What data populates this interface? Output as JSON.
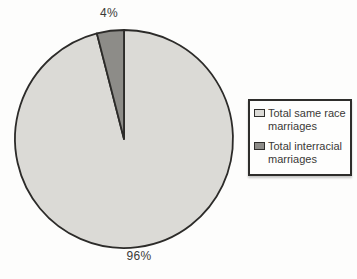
{
  "chart_data": {
    "type": "pie",
    "labels": [
      "Total same race marriages",
      "Total interracial marriages"
    ],
    "values": [
      96,
      4
    ],
    "value_labels": [
      "96%",
      "4%"
    ],
    "colors": [
      "#dbdad6",
      "#8d8c88"
    ],
    "stroke_color": "#2c2b29",
    "title": "",
    "legend_position": "right",
    "start_angle_deg": 0,
    "direction": "clockwise"
  },
  "legend": {
    "border_color": "#2e2d2b",
    "background": "#fefefd"
  }
}
